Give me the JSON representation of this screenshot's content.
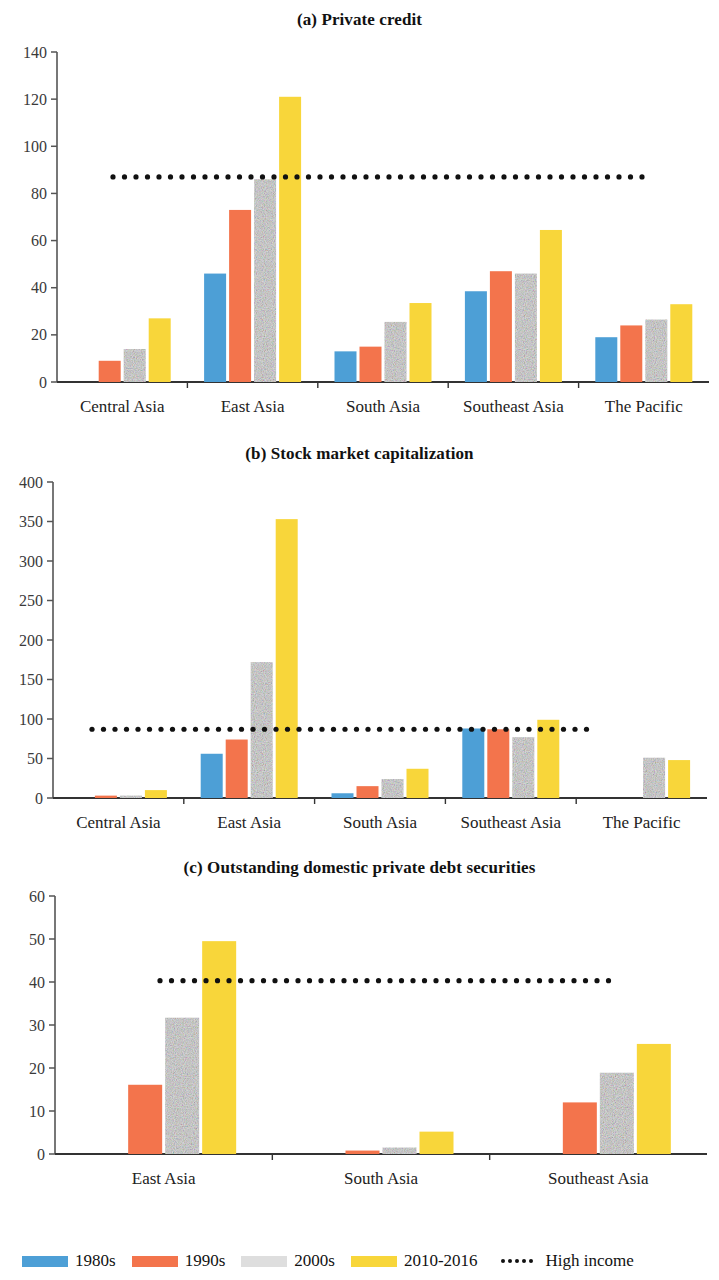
{
  "figure": {
    "series_colors": {
      "1980s": "#4d9fd6",
      "1990s": "#f3744c",
      "2000s": "#dedede",
      "2010-2016": "#f8d63a",
      "high_income": "#111111"
    }
  },
  "legend": {
    "items": [
      {
        "label": "1980s",
        "type": "swatch",
        "color": "#4d9fd6",
        "icon": "blue-swatch-icon"
      },
      {
        "label": "1990s",
        "type": "swatch",
        "color": "#f3744c",
        "icon": "orange-swatch-icon"
      },
      {
        "label": "2000s",
        "type": "swatch",
        "color": "#dedede",
        "icon": "gray-swatch-icon"
      },
      {
        "label": "2010-2016",
        "type": "swatch",
        "color": "#f8d63a",
        "icon": "yellow-swatch-icon"
      },
      {
        "label": "High income",
        "type": "dots",
        "color": "#111111",
        "icon": "dotted-line-icon"
      }
    ]
  },
  "chart_data": [
    {
      "type": "bar",
      "title": "(a) Private credit",
      "xlabel": "",
      "ylabel": "",
      "ylim": [
        0,
        140
      ],
      "yticks": [
        0,
        20,
        40,
        60,
        80,
        100,
        120,
        140
      ],
      "grid": false,
      "legend_position": "bottom",
      "categories": [
        "Central Asia",
        "East Asia",
        "South Asia",
        "Southeast Asia",
        "The Pacific"
      ],
      "series": [
        {
          "name": "1980s",
          "color": "#4d9fd6",
          "values": [
            null,
            46,
            13,
            38.5,
            19
          ]
        },
        {
          "name": "1990s",
          "color": "#f3744c",
          "values": [
            9,
            73,
            15,
            47,
            24
          ]
        },
        {
          "name": "2000s",
          "color": "#dedede",
          "values": [
            14,
            86,
            25.5,
            46,
            26.5
          ]
        },
        {
          "name": "2010-2016",
          "color": "#f8d63a",
          "values": [
            27,
            121,
            33.5,
            64.5,
            33
          ]
        }
      ],
      "annotations": [
        {
          "name": "High income",
          "type": "hline",
          "value": 87,
          "style": "dotted",
          "color": "#111111"
        }
      ]
    },
    {
      "type": "bar",
      "title": "(b) Stock market capitalization",
      "xlabel": "",
      "ylabel": "",
      "ylim": [
        0,
        400
      ],
      "yticks": [
        0,
        50,
        100,
        150,
        200,
        250,
        300,
        350,
        400
      ],
      "grid": false,
      "legend_position": "bottom",
      "categories": [
        "Central Asia",
        "East Asia",
        "South Asia",
        "Southeast Asia",
        "The Pacific"
      ],
      "series": [
        {
          "name": "1980s",
          "color": "#4d9fd6",
          "values": [
            null,
            56,
            6,
            88,
            null
          ]
        },
        {
          "name": "1990s",
          "color": "#f3744c",
          "values": [
            3,
            74,
            15,
            87,
            null
          ]
        },
        {
          "name": "2000s",
          "color": "#dedede",
          "values": [
            3,
            172,
            24,
            77,
            51
          ]
        },
        {
          "name": "2010-2016",
          "color": "#f8d63a",
          "values": [
            10,
            353,
            37,
            99,
            48
          ]
        }
      ],
      "annotations": [
        {
          "name": "High income",
          "type": "hline",
          "value": 87,
          "style": "dotted",
          "color": "#111111"
        }
      ]
    },
    {
      "type": "bar",
      "title": "(c) Outstanding domestic private debt securities",
      "xlabel": "",
      "ylabel": "",
      "ylim": [
        0,
        60
      ],
      "yticks": [
        0,
        10,
        20,
        30,
        40,
        50,
        60
      ],
      "grid": false,
      "legend_position": "bottom",
      "categories": [
        "East Asia",
        "South Asia",
        "Southeast Asia"
      ],
      "series": [
        {
          "name": "1980s",
          "color": "#4d9fd6",
          "values": [
            null,
            null,
            null
          ]
        },
        {
          "name": "1990s",
          "color": "#f3744c",
          "values": [
            16.1,
            0.8,
            12
          ]
        },
        {
          "name": "2000s",
          "color": "#dedede",
          "values": [
            31.7,
            1.5,
            18.9
          ]
        },
        {
          "name": "2010-2016",
          "color": "#f8d63a",
          "values": [
            49.5,
            5.2,
            25.6
          ]
        }
      ],
      "annotations": [
        {
          "name": "High income",
          "type": "hline",
          "value": 40.3,
          "style": "dotted",
          "color": "#111111"
        }
      ]
    }
  ]
}
